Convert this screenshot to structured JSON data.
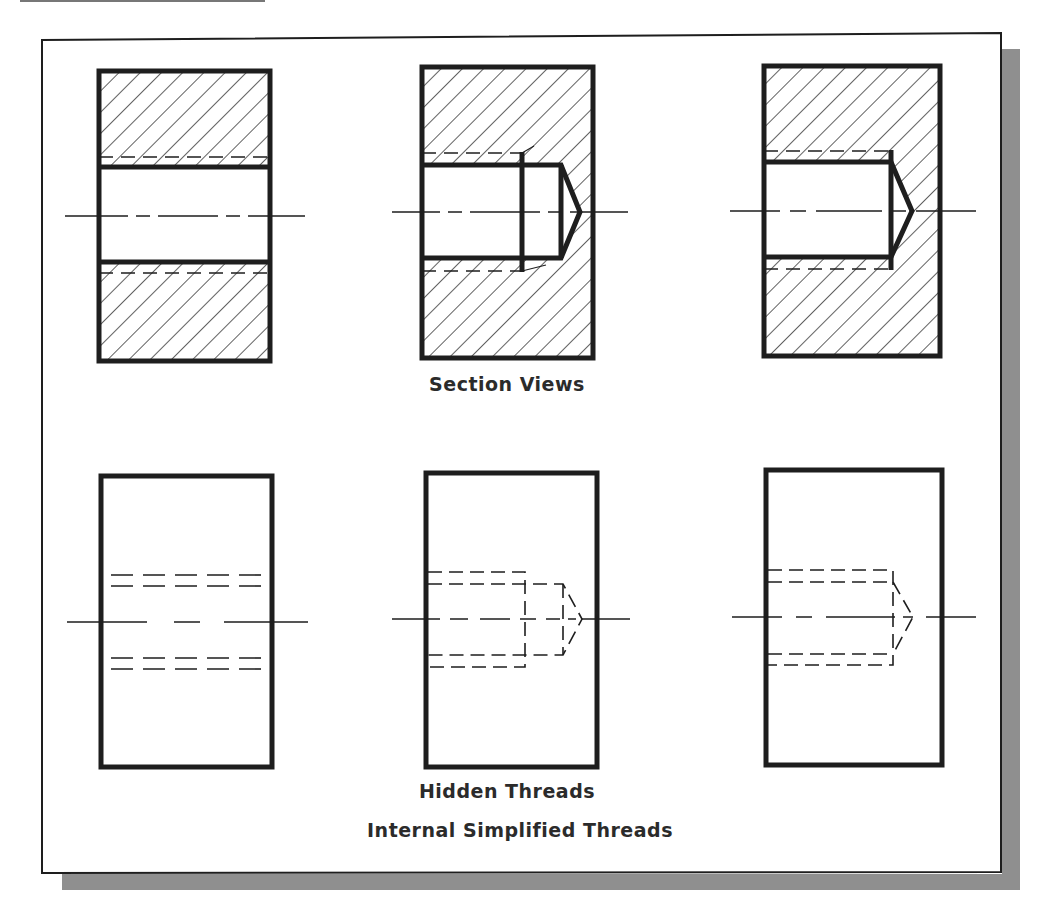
{
  "figure": {
    "section_label": "Section Views",
    "hidden_label": "Hidden Threads",
    "caption": "Internal Simplified Threads"
  },
  "colors": {
    "ink": "#1e1e1e",
    "shadow": "#8f8f8f",
    "paper": "#ffffff",
    "label": "#2b2b2b"
  },
  "views": {
    "section": [
      {
        "name": "through-hole-thread",
        "type": "section"
      },
      {
        "name": "blind-hole-thread-with-runout",
        "type": "section"
      },
      {
        "name": "blind-hole-full-thread",
        "type": "section"
      }
    ],
    "hidden": [
      {
        "name": "through-hole-thread",
        "type": "hidden"
      },
      {
        "name": "blind-hole-thread-with-runout",
        "type": "hidden"
      },
      {
        "name": "blind-hole-full-thread",
        "type": "hidden"
      }
    ]
  }
}
